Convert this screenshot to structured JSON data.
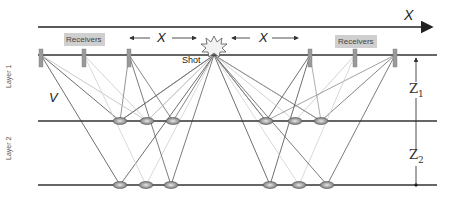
{
  "labels": {
    "x_axis": "X",
    "offset_left": "X",
    "offset_right": "X",
    "receivers_left": "Receivers",
    "receivers_right": "Receivers",
    "shot": "Shot",
    "velocity": "V",
    "layer1": "Layer 1",
    "layer2": "Layer 2",
    "z1": "Z",
    "z1_sub": "1",
    "z2": "Z",
    "z2_sub": "2"
  },
  "colors": {
    "line_dark": "#3a3a3a",
    "ray_dark": "#555555",
    "ray_mid": "#8a8a8a",
    "ray_light": "#c8c8c8",
    "receiver": "#9a9a9a",
    "label_box": "#cfcfcf"
  },
  "geometry": {
    "surface_y": 55,
    "layer1_y": 121,
    "layer2_y": 185,
    "shot": {
      "x": 214,
      "y": 55
    },
    "receivers": [
      41,
      84,
      129,
      310,
      355,
      395
    ],
    "reflect_l1": [
      120,
      147,
      173,
      266,
      295,
      321
    ],
    "reflect_l2": [
      120,
      146,
      171,
      270,
      299,
      327
    ]
  }
}
